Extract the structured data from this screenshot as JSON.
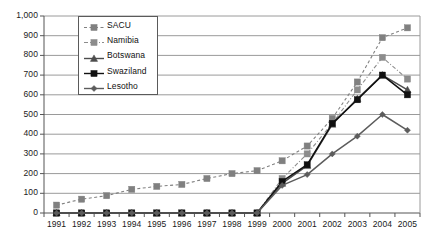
{
  "chart_data": {
    "type": "line",
    "title": "",
    "xlabel": "",
    "ylabel": "",
    "grid": true,
    "legend_position": "upper-left-inside",
    "ylim": [
      0,
      1000
    ],
    "ytick_step": 100,
    "yticks": [
      "0",
      "100",
      "200",
      "300",
      "400",
      "500",
      "600",
      "700",
      "800",
      "900",
      "1,000"
    ],
    "categories": [
      "1991",
      "1992",
      "1993",
      "1994",
      "1995",
      "1996",
      "1997",
      "1998",
      "1999",
      "2000",
      "2001",
      "2002",
      "2003",
      "2004",
      "2005"
    ],
    "series": [
      {
        "name": "SACU",
        "marker": "square",
        "line_style": "dashed",
        "color": "#808080",
        "values": [
          40,
          70,
          88,
          120,
          135,
          145,
          175,
          200,
          215,
          265,
          340,
          480,
          665,
          890,
          940
        ]
      },
      {
        "name": "Namibia",
        "marker": "square",
        "line_style": "dash-dot",
        "color": "#8c8c8c",
        "values": [
          0,
          0,
          0,
          0,
          0,
          0,
          0,
          0,
          0,
          175,
          300,
          455,
          625,
          790,
          680
        ]
      },
      {
        "name": "Botswana",
        "marker": "triangle",
        "line_style": "solid",
        "color": "#4d4d4d",
        "values": [
          0,
          0,
          0,
          0,
          0,
          0,
          0,
          0,
          0,
          150,
          240,
          450,
          580,
          700,
          625
        ]
      },
      {
        "name": "Swaziland",
        "marker": "square",
        "line_style": "solid",
        "color": "#111111",
        "values": [
          0,
          0,
          0,
          0,
          0,
          0,
          0,
          0,
          0,
          160,
          245,
          455,
          575,
          700,
          600
        ]
      },
      {
        "name": "Lesotho",
        "marker": "diamond",
        "line_style": "solid",
        "color": "#5c5c5c",
        "values": [
          0,
          0,
          0,
          0,
          0,
          0,
          0,
          0,
          0,
          140,
          195,
          300,
          390,
          500,
          420
        ]
      }
    ]
  }
}
